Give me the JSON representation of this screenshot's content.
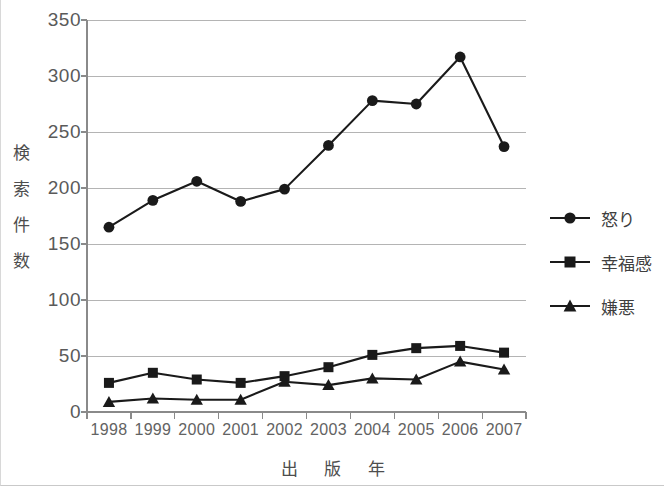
{
  "chart_data": {
    "type": "line",
    "title": "",
    "xlabel": "出 版 年",
    "ylabel": "検索件数",
    "ylabel_chars": [
      "検",
      "索",
      "件",
      "数"
    ],
    "categories": [
      "1998",
      "1999",
      "2000",
      "2001",
      "2002",
      "2003",
      "2004",
      "2005",
      "2006",
      "2007"
    ],
    "ylim": [
      0,
      350
    ],
    "yticks": [
      0,
      50,
      100,
      150,
      200,
      250,
      300,
      350
    ],
    "ytick_labels": [
      "0",
      "50",
      "100",
      "150",
      "200",
      "250",
      "300",
      "350"
    ],
    "grid": true,
    "grid_axis": "y",
    "legend_position": "right",
    "series": [
      {
        "name": "怒り",
        "marker": "circle",
        "color": "#1a1a1a",
        "values": [
          165,
          189,
          206,
          188,
          199,
          238,
          278,
          275,
          317,
          237
        ]
      },
      {
        "name": "幸福感",
        "marker": "square",
        "color": "#1a1a1a",
        "values": [
          26,
          35,
          29,
          26,
          32,
          40,
          51,
          57,
          59,
          53
        ]
      },
      {
        "name": "嫌悪",
        "marker": "triangle",
        "color": "#1a1a1a",
        "values": [
          9,
          12,
          11,
          11,
          27,
          24,
          30,
          29,
          45,
          38
        ]
      }
    ]
  },
  "colors": {
    "ink": "#1a1a1a",
    "grid": "#b4b4b4",
    "axis": "#8a8a8a",
    "tick_text": "#5a5a5a",
    "frame": "#d0d0d0",
    "background": "#ffffff"
  }
}
